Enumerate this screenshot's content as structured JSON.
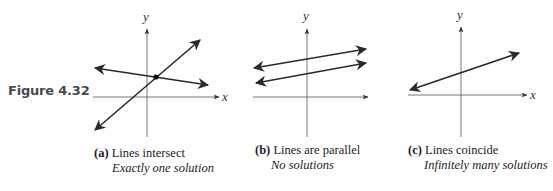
{
  "figure": {
    "label": "Figure 4.32"
  },
  "panels": [
    {
      "id": "a",
      "tag": "(a)",
      "title": "Lines intersect",
      "subtitle": "Exactly one solution",
      "x_label": "x",
      "y_label": "y"
    },
    {
      "id": "b",
      "tag": "(b)",
      "title": "Lines are parallel",
      "subtitle": "No solutions",
      "x_label": "x",
      "y_label": "y"
    },
    {
      "id": "c",
      "tag": "(c)",
      "title": "Lines coincide",
      "subtitle": "Infinitely many solutions",
      "x_label": "x",
      "y_label": "y"
    }
  ],
  "colors": {
    "line": "#2a2a2a",
    "axis": "#555555",
    "point": "#111111"
  }
}
